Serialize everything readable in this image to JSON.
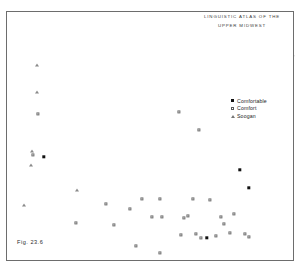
{
  "figure": {
    "title_line1": "Linguistic Atlas of the",
    "title_line2": "Upper Midwest",
    "caption": "Fig. 23.6"
  },
  "legend": {
    "items": [
      {
        "label": "Comfortable",
        "symbol": "filled-square",
        "color": "#111111"
      },
      {
        "label": "Comfort",
        "symbol": "open-square",
        "color": "#707070"
      },
      {
        "label": "Soogan",
        "symbol": "triangle",
        "color": "#8a8a8a"
      }
    ]
  },
  "chart_data": {
    "type": "map",
    "title": "Linguistic Atlas of the Upper Midwest",
    "subtitle": "Distribution of terms: Comfortable, Comfort, Soogan",
    "region": "Upper Midwest (North Dakota, South Dakota, Nebraska, Minnesota, Iowa, Wisconsin)",
    "legend_position": "right-center",
    "categories": [
      "Comfortable",
      "Comfort",
      "Soogan"
    ],
    "counts": {
      "Comfortable": 4,
      "Comfort": 28,
      "Soogan": 9
    },
    "series": [
      {
        "name": "Comfortable",
        "symbol": "filled-square",
        "points": [
          {
            "x": 44,
            "y": 157
          },
          {
            "x": 240,
            "y": 170
          },
          {
            "x": 249,
            "y": 188
          },
          {
            "x": 207,
            "y": 238
          }
        ]
      },
      {
        "name": "Comfort",
        "symbol": "open-square",
        "points": [
          {
            "x": 38,
            "y": 114
          },
          {
            "x": 33,
            "y": 155
          },
          {
            "x": 179,
            "y": 112
          },
          {
            "x": 199,
            "y": 130
          },
          {
            "x": 106,
            "y": 204
          },
          {
            "x": 130,
            "y": 209
          },
          {
            "x": 142,
            "y": 199
          },
          {
            "x": 76,
            "y": 223
          },
          {
            "x": 114,
            "y": 225
          },
          {
            "x": 136,
            "y": 246
          },
          {
            "x": 160,
            "y": 253
          },
          {
            "x": 160,
            "y": 199
          },
          {
            "x": 152,
            "y": 217
          },
          {
            "x": 162,
            "y": 217
          },
          {
            "x": 184,
            "y": 218
          },
          {
            "x": 193,
            "y": 199
          },
          {
            "x": 210,
            "y": 200
          },
          {
            "x": 188,
            "y": 216
          },
          {
            "x": 221,
            "y": 217
          },
          {
            "x": 234,
            "y": 214
          },
          {
            "x": 224,
            "y": 224
          },
          {
            "x": 181,
            "y": 235
          },
          {
            "x": 196,
            "y": 234
          },
          {
            "x": 201,
            "y": 238
          },
          {
            "x": 230,
            "y": 233
          },
          {
            "x": 245,
            "y": 234
          },
          {
            "x": 249,
            "y": 237
          },
          {
            "x": 216,
            "y": 236
          }
        ]
      },
      {
        "name": "Soogan",
        "symbol": "triangle",
        "points": [
          {
            "x": 37,
            "y": 65
          },
          {
            "x": 37,
            "y": 92
          },
          {
            "x": 32,
            "y": 151
          },
          {
            "x": 31,
            "y": 165
          },
          {
            "x": 77,
            "y": 190
          },
          {
            "x": 24,
            "y": 205
          }
        ]
      }
    ]
  }
}
